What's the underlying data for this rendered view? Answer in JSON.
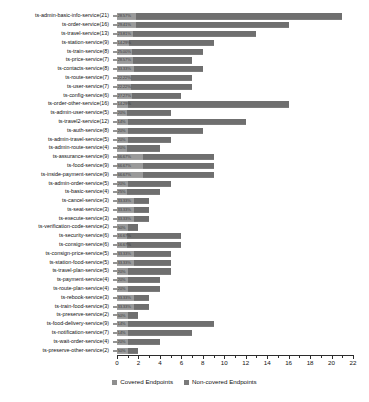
{
  "chart_data": {
    "type": "bar",
    "subtype": "horizontal-stacked",
    "title": "",
    "xlabel": "",
    "ylabel": "",
    "xlim": [
      0,
      22
    ],
    "xticks": [
      0,
      2,
      4,
      6,
      8,
      10,
      12,
      14,
      16,
      18,
      20,
      22
    ],
    "minor_tick_step": 1,
    "grid": false,
    "legend_position": "bottom",
    "legend": [
      "Covered Endpoints",
      "Non-covered Endpoints"
    ],
    "colors": {
      "covered": "#9a9a9a",
      "non_covered": "#6f6f6f"
    },
    "categories": [
      "ts-admin-basic-info-service(21)",
      "ts-order-service(16)",
      "ts-travel-service(13)",
      "ts-station-service(9)",
      "ts-train-service(8)",
      "ts-price-service(7)",
      "ts-contacts-service(8)",
      "ts-route-service(7)",
      "ts-user-service(7)",
      "ts-config-service(6)",
      "ts-order-other-service(16)",
      "ts-admin-user-service(5)",
      "ts-travel2-service(12)",
      "ts-auth-service(8)",
      "ts-admin-travel-service(5)",
      "ts-admin-route-service(4)",
      "ts-assurance-service(9)",
      "ts-food-service(9)",
      "ts-inside-payment-service(9)",
      "ts-admin-order-service(5)",
      "ts-basic-service(4)",
      "ts-cancel-service(3)",
      "ts-seat-service(3)",
      "ts-execute-service(3)",
      "ts-verification-code-service(2)",
      "ts-security-service(6)",
      "ts-consign-service(6)",
      "ts-consign-price-service(5)",
      "ts-station-food-service(5)",
      "ts-travel-plan-service(5)",
      "ts-payment-service(4)",
      "ts-route-plan-service(4)",
      "ts-rebook-service(3)",
      "ts-train-food-service(3)",
      "ts-preserve-service(2)",
      "ts-food-delivery-service(9)",
      "ts-notification-service(7)",
      "ts-wait-order-service(4)",
      "ts-preserve-other-service(2)"
    ],
    "series": [
      {
        "name": "Covered Endpoints",
        "values": [
          1.8,
          1.8,
          1.5,
          1.1,
          1.4,
          1.5,
          1.6,
          1.3,
          1.3,
          1.4,
          1.0,
          0.9,
          1.0,
          1.0,
          1.0,
          0.9,
          2.4,
          2.4,
          2.4,
          1.0,
          0.9,
          1.6,
          1.6,
          1.6,
          1.0,
          0.9,
          0.9,
          1.6,
          1.6,
          1.0,
          1.0,
          1.0,
          1.6,
          1.6,
          1.0,
          1.0,
          1.0,
          1.0,
          1.0
        ]
      },
      {
        "name": "Non-covered Endpoints",
        "values": [
          19.2,
          14.2,
          11.5,
          7.9,
          6.6,
          5.5,
          6.4,
          5.7,
          5.7,
          4.6,
          15.0,
          4.1,
          11.0,
          7.0,
          4.0,
          3.1,
          6.6,
          6.6,
          6.6,
          4.0,
          3.1,
          1.4,
          1.4,
          1.4,
          1.0,
          5.1,
          5.1,
          3.4,
          3.4,
          4.0,
          3.0,
          3.0,
          1.4,
          1.4,
          1.0,
          8.0,
          6.0,
          3.0,
          1.0
        ]
      }
    ],
    "totals": [
      21,
      16,
      13,
      9,
      8,
      7,
      8,
      7,
      7,
      6,
      16,
      5,
      12,
      8,
      5,
      4,
      9,
      9,
      9,
      5,
      4,
      3,
      3,
      3,
      2,
      6,
      6,
      5,
      5,
      5,
      4,
      4,
      3,
      3,
      2,
      9,
      7,
      4,
      2
    ],
    "bar_labels": [
      "28.57%",
      "29.41%",
      "23.81%",
      "14.29%",
      "25.00%",
      "28.57%",
      "33.33%",
      "22.22%",
      "22.22%",
      "27.27%",
      "14.29%",
      "20%",
      "14%",
      "20%",
      "20%",
      "20%",
      "66.67%",
      "66.67%",
      "66.67%",
      "20%",
      "25%",
      "33.33%",
      "33.33%",
      "33.33%",
      "50%",
      "16.67%",
      "16.67%",
      "33.33%",
      "33.33%",
      "20%",
      "20%",
      "20%",
      "33.33%",
      "33.33%",
      "50%",
      "14%",
      "14%",
      "20%",
      "50%"
    ]
  }
}
